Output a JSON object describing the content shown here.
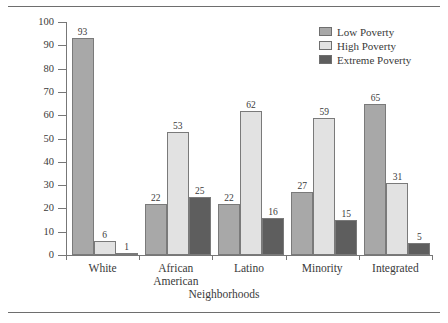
{
  "chart_data": {
    "type": "bar",
    "title": "",
    "xlabel": "Neighborhoods",
    "ylabel": "Percentage",
    "ylim": [
      0,
      100
    ],
    "yticks": [
      0,
      10,
      20,
      30,
      40,
      50,
      60,
      70,
      80,
      90,
      100
    ],
    "grid": false,
    "legend_position": "top-right",
    "categories": [
      "White",
      "African American",
      "Latino",
      "Minority",
      "Integrated"
    ],
    "category_lines": [
      [
        "White"
      ],
      [
        "African",
        "American"
      ],
      [
        "Latino"
      ],
      [
        "Minority"
      ],
      [
        "Integrated"
      ]
    ],
    "series": [
      {
        "name": "Low Poverty",
        "color": "#a8a8a8",
        "values": [
          93,
          22,
          22,
          27,
          65
        ]
      },
      {
        "name": "High Poverty",
        "color": "#e2e2e2",
        "values": [
          6,
          53,
          62,
          59,
          31
        ]
      },
      {
        "name": "Extreme Poverty",
        "color": "#5e5e5e",
        "values": [
          1,
          25,
          16,
          15,
          5
        ]
      }
    ]
  },
  "colors": {
    "low_poverty": "#a8a8a8",
    "high_poverty": "#e2e2e2",
    "extreme_poverty": "#5e5e5e",
    "axis": "#777777",
    "text": "#3a3a3a",
    "rule": "#6e6e6e"
  }
}
